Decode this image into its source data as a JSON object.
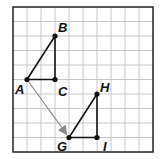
{
  "grid": {
    "cols": 10,
    "rows": 10,
    "left": 13,
    "top": 7,
    "cell_w": 14,
    "cell_h": 14.5
  },
  "points": [
    {
      "id": "A",
      "label": "A",
      "x": 1,
      "y": 5,
      "lx": -12,
      "ly": 14
    },
    {
      "id": "B",
      "label": "B",
      "x": 3,
      "y": 2,
      "lx": 3,
      "ly": -4
    },
    {
      "id": "C",
      "label": "C",
      "x": 3,
      "y": 5,
      "lx": 3,
      "ly": 16
    },
    {
      "id": "G",
      "label": "G",
      "x": 4,
      "y": 9,
      "lx": -12,
      "ly": 13
    },
    {
      "id": "H",
      "label": "H",
      "x": 6,
      "y": 6,
      "lx": 3,
      "ly": -2
    },
    {
      "id": "I",
      "label": "I",
      "x": 6,
      "y": 9,
      "lx": 6,
      "ly": 13
    }
  ],
  "triangles": [
    [
      "A",
      "B",
      "C"
    ],
    [
      "G",
      "H",
      "I"
    ]
  ],
  "arrow": {
    "from": "A",
    "to": "G",
    "color": "#888888"
  },
  "colors": {
    "grid": "#c8c8c8",
    "border": "#222222",
    "shape": "#111111"
  }
}
